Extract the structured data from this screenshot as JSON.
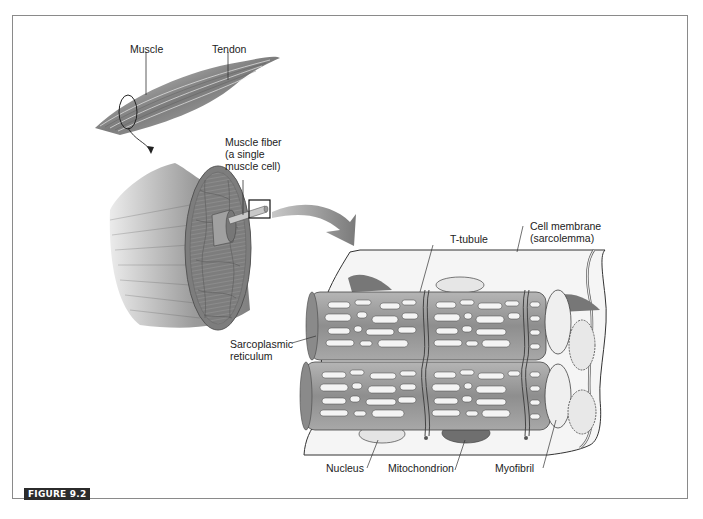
{
  "figure": {
    "tag": "FIGURE 9.2"
  },
  "labels": {
    "muscle": "Muscle",
    "tendon": "Tendon",
    "muscle_fiber": "Muscle fiber\n(a single\nmuscle cell)",
    "t_tubule": "T-tubule",
    "cell_membrane": "Cell membrane\n(sarcolemma)",
    "sarcoplasmic_reticulum": "Sarcoplasmic\nreticulum",
    "nucleus": "Nucleus",
    "mitochondrion": "Mitochondrion",
    "myofibril": "Myofibril"
  },
  "colors": {
    "frame": "#8a8a8a",
    "tag_bg": "#2b2b2b",
    "fiber_gray": "#9a9a9a",
    "membrane_fill": "#f4f4f4",
    "arrow_gray": "#8c8c8c"
  }
}
